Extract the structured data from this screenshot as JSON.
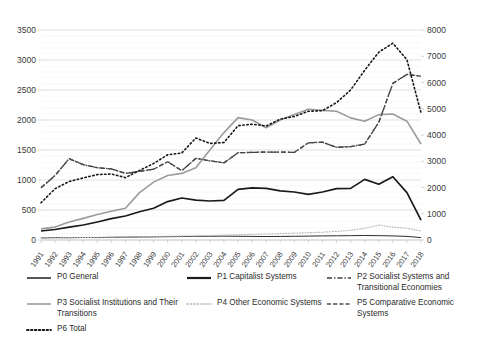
{
  "chart_data": {
    "type": "line",
    "title": "",
    "subtitle": "",
    "xlabel": "",
    "ylabel": "",
    "y2label": "",
    "grid": true,
    "legend_position": "bottom",
    "x": [
      1991,
      1992,
      1993,
      1994,
      1995,
      1996,
      1997,
      1998,
      1999,
      2000,
      2001,
      2002,
      2003,
      2004,
      2005,
      2006,
      2007,
      2008,
      2009,
      2010,
      2011,
      2012,
      2013,
      2014,
      2015,
      2016,
      2017,
      2018
    ],
    "xtick_labels": [
      "1991",
      "1992",
      "1993",
      "1994",
      "1995",
      "1996",
      "1997",
      "1998",
      "1999",
      "2000",
      "2001",
      "2002",
      "2003",
      "2004",
      "2005",
      "2006",
      "2007",
      "2008",
      "2009",
      "2010",
      "2011",
      "2012",
      "2013",
      "2014",
      "2015",
      "2016",
      "2017",
      "2018"
    ],
    "ylim": [
      0,
      3500
    ],
    "ytick_labels": [
      "0",
      "500",
      "1000",
      "1500",
      "2000",
      "2500",
      "3000",
      "3500"
    ],
    "yticks": [
      0,
      500,
      1000,
      1500,
      2000,
      2500,
      3000,
      3500
    ],
    "y2lim": [
      0,
      8000
    ],
    "y2tick_labels": [
      "0",
      "1000",
      "2000",
      "3000",
      "4000",
      "5000",
      "6000",
      "7000",
      "8000"
    ],
    "y2ticks": [
      0,
      1000,
      2000,
      3000,
      4000,
      5000,
      6000,
      7000,
      8000
    ],
    "series": [
      {
        "name": "P0 General",
        "key": "P0",
        "axis": "left",
        "color": "#2b2b2b",
        "style": "solid",
        "width": 1.0,
        "values": [
          35,
          40,
          38,
          42,
          40,
          45,
          48,
          50,
          52,
          55,
          58,
          60,
          62,
          65,
          62,
          60,
          58,
          60,
          62,
          65,
          68,
          70,
          72,
          75,
          72,
          68,
          60,
          40
        ]
      },
      {
        "name": "P1 Capitalist Systems",
        "key": "P1",
        "axis": "left",
        "color": "#1a1a1a",
        "style": "solid",
        "width": 1.7,
        "values": [
          150,
          175,
          215,
          250,
          300,
          355,
          400,
          470,
          530,
          640,
          700,
          665,
          650,
          660,
          845,
          870,
          860,
          820,
          800,
          760,
          800,
          855,
          860,
          1010,
          930,
          1055,
          790,
          330
        ]
      },
      {
        "name": "P2 Socialist Systems and Transitional Economies",
        "key": "P2",
        "axis": "left",
        "color": "#3c3c3c",
        "style": "dashdot",
        "width": 1.3,
        "values": [
          870,
          1075,
          1355,
          1255,
          1205,
          1185,
          1110,
          1145,
          1180,
          1305,
          1155,
          1360,
          1320,
          1285,
          1455,
          1460,
          1465,
          1465,
          1460,
          1620,
          1630,
          1545,
          1555,
          1600,
          1960,
          2610,
          2760,
          2730
        ]
      },
      {
        "name": "P3 Socialist Institutions and Their Transitions",
        "key": "P3",
        "axis": "left",
        "color": "#9b9b9b",
        "style": "solid",
        "width": 1.6,
        "values": [
          185,
          215,
          300,
          360,
          425,
          480,
          530,
          790,
          965,
          1075,
          1110,
          1205,
          1500,
          1790,
          2040,
          2000,
          1870,
          2000,
          2090,
          2180,
          2160,
          2145,
          2035,
          1980,
          2090,
          2100,
          1980,
          1600
        ]
      },
      {
        "name": "P4 Other Economic Systems",
        "key": "P4",
        "axis": "left",
        "color": "#b5b5b5",
        "style": "dotted",
        "width": 1.1,
        "values": [
          35,
          38,
          40,
          42,
          45,
          48,
          52,
          55,
          58,
          62,
          65,
          68,
          72,
          80,
          88,
          95,
          100,
          108,
          115,
          122,
          130,
          145,
          160,
          195,
          250,
          215,
          195,
          150
        ]
      },
      {
        "name": "P5 Comparative Economic Systems",
        "key": "P5",
        "axis": "left",
        "color": "#4a4a4a",
        "style": "dashed",
        "width": 1.3,
        "values": [
          870,
          1075,
          1355,
          1255,
          1205,
          1185,
          1110,
          1145,
          1180,
          1305,
          1155,
          1360,
          1320,
          1285,
          1455,
          1460,
          1465,
          1465,
          1460,
          1620,
          1630,
          1545,
          1555,
          1600,
          1960,
          2610,
          2760,
          2730
        ]
      },
      {
        "name": "P6 Total",
        "key": "P6",
        "axis": "left",
        "color": "#161616",
        "style": "dotted",
        "width": 1.6,
        "values": [
          620,
          855,
          975,
          1035,
          1090,
          1100,
          1040,
          1160,
          1275,
          1420,
          1450,
          1700,
          1610,
          1625,
          1905,
          1930,
          1900,
          2015,
          2060,
          2145,
          2155,
          2290,
          2500,
          2830,
          3130,
          3280,
          3005,
          2120
        ]
      }
    ]
  },
  "legend": {
    "items": [
      {
        "label": "P0 General",
        "style": "solid-thin",
        "color": "#2b2b2b"
      },
      {
        "label": "P1 Capitalist Systems",
        "style": "solid-thick",
        "color": "#1a1a1a"
      },
      {
        "label": "P2 Socialist Systems and Transitional Economies",
        "style": "dashdot",
        "color": "#3c3c3c"
      },
      {
        "label": "P3 Socialist Institutions and Their Transitions",
        "style": "solid-gray",
        "color": "#9b9b9b"
      },
      {
        "label": "P4 Other Economic Systems",
        "style": "dotted-gray",
        "color": "#b5b5b5"
      },
      {
        "label": "P5 Comparative Economic Systems",
        "style": "dashed",
        "color": "#4a4a4a"
      },
      {
        "label": "P6 Total",
        "style": "dotted-black",
        "color": "#161616"
      }
    ]
  }
}
